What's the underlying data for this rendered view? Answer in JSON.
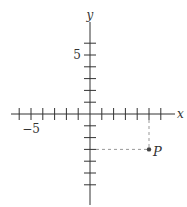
{
  "diagram": {
    "x_axis_label": "x",
    "y_axis_label": "y",
    "x_range": [
      -7,
      6
    ],
    "y_range": [
      -7,
      6
    ],
    "x_ticks": [
      -6,
      -5,
      -4,
      -3,
      -2,
      -1,
      1,
      2,
      3,
      4,
      5,
      6
    ],
    "y_ticks": [
      -6,
      -5,
      -4,
      -3,
      -2,
      -1,
      1,
      2,
      3,
      4,
      5,
      6
    ],
    "x_tick_labels": [
      {
        "value": -5,
        "text": "−5"
      }
    ],
    "y_tick_labels": [
      {
        "value": 5,
        "text": "5"
      }
    ],
    "point": {
      "label": "P",
      "x": 5,
      "y": -3
    },
    "colors": {
      "axis": "#333333",
      "dashed": "#999999",
      "point": "#444444"
    }
  }
}
